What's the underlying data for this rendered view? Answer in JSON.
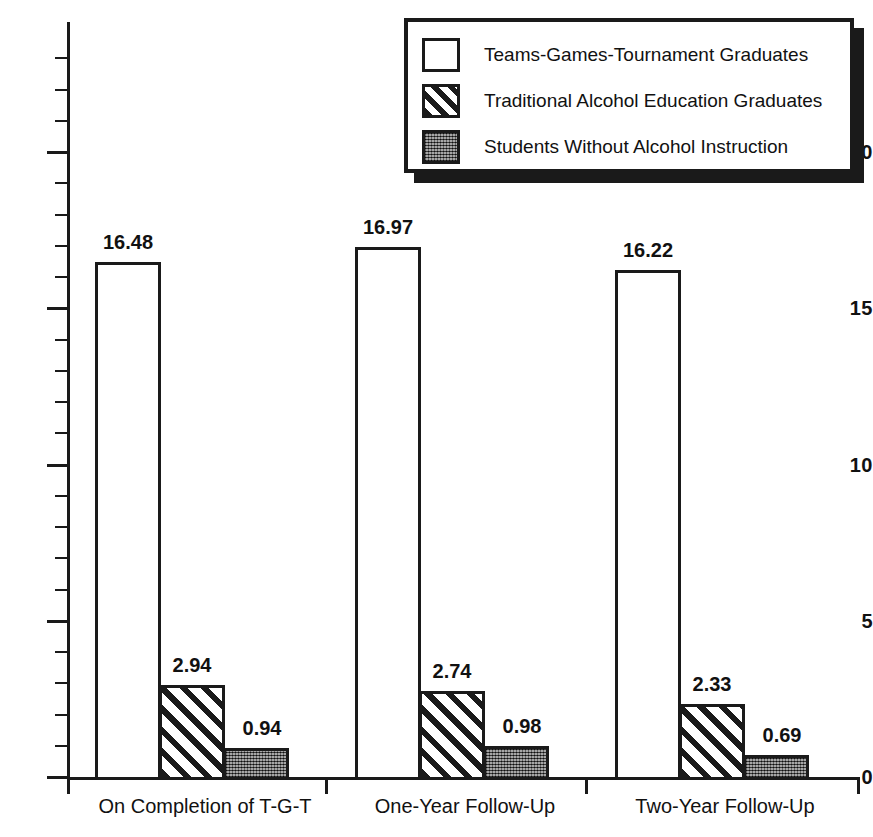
{
  "chart_data": {
    "type": "bar",
    "title": "",
    "subtitle": "",
    "xlabel": "",
    "ylabel": "",
    "ylim": [
      0,
      23.5
    ],
    "yticks": [
      0,
      5,
      10,
      15,
      20
    ],
    "ytick_labels": [
      "0",
      "5",
      "10",
      "15",
      "20"
    ],
    "y_minor_tick_step": 1,
    "grid": false,
    "legend_position": "top-right",
    "categories": [
      "On Completion of T-G-T",
      "One-Year Follow-Up",
      "Two-Year Follow-Up"
    ],
    "series": [
      {
        "name": "Teams-Games-Tournament Graduates",
        "pattern": "white-outline",
        "values": [
          16.48,
          16.97,
          16.22
        ],
        "labels": [
          "16.48",
          "16.97",
          "16.22"
        ]
      },
      {
        "name": "Traditional Alcohol Education Graduates",
        "pattern": "diagonal-hatch",
        "values": [
          2.94,
          2.74,
          2.33
        ],
        "labels": [
          "2.94",
          "2.74",
          "2.33"
        ]
      },
      {
        "name": "Students Without Alcohol Instruction",
        "pattern": "dark-checker",
        "values": [
          0.94,
          0.98,
          0.69
        ],
        "labels": [
          "0.94",
          "0.98",
          "0.69"
        ]
      }
    ]
  },
  "colors": {
    "ink": "#1a1a1a",
    "background": "#ffffff",
    "dark_fill": "#4a4a4a"
  }
}
